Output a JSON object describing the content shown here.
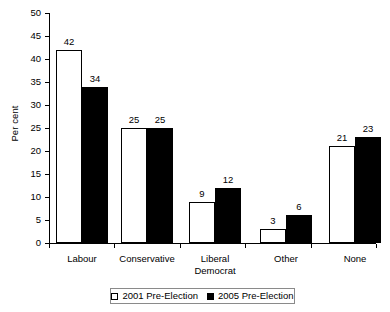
{
  "chart_data": {
    "type": "bar",
    "title": "",
    "subtitle": "",
    "xlabel": "",
    "ylabel": "Per cent",
    "ylim": [
      0,
      50
    ],
    "ytick_step": 5,
    "yticks": [
      "50",
      "45",
      "40",
      "35",
      "30",
      "25",
      "20",
      "15",
      "10",
      "5",
      "0"
    ],
    "grid": false,
    "legend_position": "bottom",
    "categories": [
      "Labour",
      "Conservative",
      "Liberal Democrat",
      "Other",
      "None"
    ],
    "category_label_lines": [
      [
        "Labour"
      ],
      [
        "Conservative"
      ],
      [
        "Liberal",
        "Democrat"
      ],
      [
        "Other"
      ],
      [
        "None"
      ]
    ],
    "series": [
      {
        "name": "2001 Pre-Election",
        "style": "open",
        "color": "#ffffff",
        "edge_color": "#000000",
        "values": [
          42,
          25,
          9,
          3,
          21
        ],
        "value_labels": [
          "42",
          "25",
          "9",
          "3",
          "21"
        ]
      },
      {
        "name": "2005 Pre-Election",
        "style": "filled",
        "color": "#000000",
        "edge_color": "#000000",
        "values": [
          34,
          25,
          12,
          6,
          23
        ],
        "value_labels": [
          "34",
          "25",
          "12",
          "6",
          "23"
        ]
      }
    ]
  },
  "legend": {
    "entries": [
      {
        "label": "2001 Pre-Election",
        "swatch": "open-square-icon"
      },
      {
        "label": "2005 Pre-Election",
        "swatch": "filled-square-icon"
      }
    ]
  },
  "axes": {
    "y_axis_title": "Per cent"
  }
}
